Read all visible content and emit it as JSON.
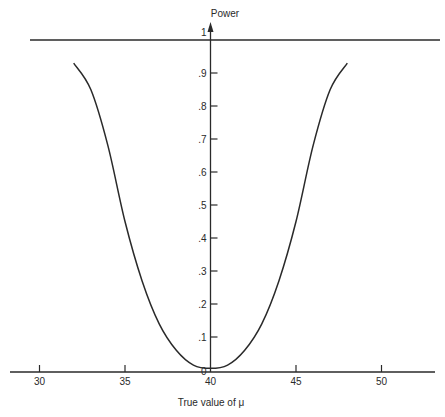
{
  "chart_data": {
    "type": "line",
    "title": "",
    "xlabel": "True value of μ",
    "ylabel": "Power",
    "x_ticks": [
      "30",
      "35",
      "40",
      "45",
      "50"
    ],
    "y_ticks": [
      "0",
      ".1",
      ".2",
      ".3",
      ".4",
      ".5",
      ".6",
      ".7",
      ".8",
      ".9",
      "1"
    ],
    "xlim": [
      29.5,
      53.5
    ],
    "ylim": [
      0,
      1
    ],
    "grid": false,
    "reference_line": {
      "y": 1
    },
    "series": [
      {
        "name": "Power curve",
        "x": [
          32,
          33,
          34,
          35,
          36,
          37,
          38,
          39,
          40,
          41,
          42,
          43,
          44,
          45,
          46,
          47,
          48
        ],
        "values": [
          0.93,
          0.85,
          0.68,
          0.45,
          0.27,
          0.14,
          0.06,
          0.015,
          0.005,
          0.015,
          0.06,
          0.14,
          0.27,
          0.45,
          0.68,
          0.85,
          0.93
        ]
      }
    ]
  }
}
